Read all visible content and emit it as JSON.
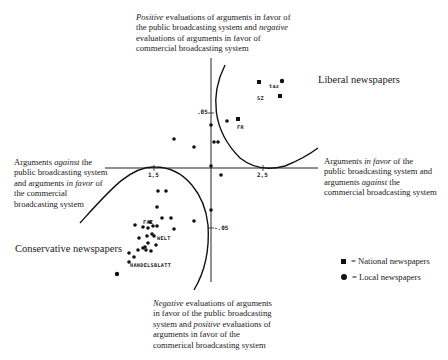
{
  "diagram": {
    "labels": {
      "top": {
        "line1_italic": "Positive",
        "line1_rest": " evaluations of arguments in favor of",
        "line2_pre": "the public broadcasting system and ",
        "line2_italic": "negative",
        "line3": "evaluations of arguments in favor of",
        "line4": "commercial broadcasting system"
      },
      "left": {
        "line1_pre": "Arguments ",
        "line1_italic": "against",
        "line1_post": " the",
        "line2": "public broadcasting system",
        "line3_pre": "and arguments ",
        "line3_italic": "in favor",
        "line3_post": " of",
        "line4": "the commercial",
        "line5": "broadcasting system"
      },
      "right": {
        "line1_pre": "Arguments ",
        "line1_italic": "in favor",
        "line1_post": " of the",
        "line2": "public broadcasting system and",
        "line3_pre": "arguments ",
        "line3_italic": "against",
        "line3_post": " the",
        "line4": "commercial broadcasting system"
      },
      "bottom": {
        "line1_italic": "Negative",
        "line1_rest": " evaluations of arguments",
        "line2": "in favor of the public broadcasting",
        "line3_pre": "system and ",
        "line3_italic": "positive",
        "line3_post": " evaluations of",
        "line4": "arguments in favor of the",
        "line5": "commerical broadcasting system"
      }
    },
    "groups": {
      "liberal": "Liberal newspapers",
      "conservative": "Conservative newspapers"
    },
    "axis_ticks": {
      "y_pos": ".05",
      "y_neg": "-.05",
      "x_neg": "1,5",
      "x_pos": "2,5"
    },
    "point_labels": {
      "taz": "taz",
      "sz": "SZ",
      "fr": "FR",
      "faz": "FAZ",
      "welt": "WELT",
      "handelsblatt": "HANDELSBLATT"
    },
    "legend": {
      "national": "= National newspapers",
      "local": "= Local newspapers"
    }
  }
}
